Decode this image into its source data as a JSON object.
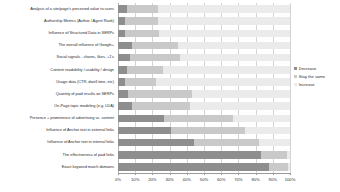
{
  "chart_data": {
    "type": "bar",
    "subtype": "100-percent-stacked-horizontal",
    "title": "",
    "xlabel": "",
    "ylabel": "",
    "xlim": [
      0,
      100
    ],
    "xticks": [
      "0%",
      "10%",
      "20%",
      "30%",
      "40%",
      "50%",
      "60%",
      "70%",
      "80%",
      "90%",
      "100%"
    ],
    "grid": true,
    "legend_position": "right",
    "legend": [
      "Decrease",
      "Stay the same",
      "Increase"
    ],
    "colors": {
      "decrease": "#8e8e8e",
      "stay_the_same": "#c9c9c9",
      "increase": "#ebebeb"
    },
    "categories": [
      "Analysis of a site/page's perceived value to users",
      "Authorship Metrics (Author / Agent Rank)",
      "Influence of Structured Data in SERPs",
      "The overall influence of Google+",
      "Social signals - shares, likes, +1's",
      "Content readability / usability / design",
      "Usage data (CTR, dwell time, etc)",
      "Quantity of paid results on SERPs",
      "On-Page topic modeling (e.g. LDA)",
      "Presence + prominence of advertising vs. content",
      "Influence of Anchor text in external links",
      "Influence of Anchor text in internal links",
      "The effectiveness of paid links",
      "Exact keyword match domains"
    ],
    "series": [
      {
        "name": "Decrease",
        "values": [
          5,
          4,
          4,
          8,
          7,
          5,
          4,
          6,
          8,
          27,
          31,
          44,
          83,
          88
        ]
      },
      {
        "name": "Stay the same",
        "values": [
          18,
          19,
          20,
          27,
          29,
          21,
          18,
          37,
          34,
          40,
          43,
          38,
          15,
          11
        ]
      },
      {
        "name": "Increase",
        "values": [
          77,
          77,
          76,
          65,
          64,
          74,
          78,
          57,
          58,
          33,
          26,
          18,
          2,
          1
        ]
      }
    ]
  }
}
